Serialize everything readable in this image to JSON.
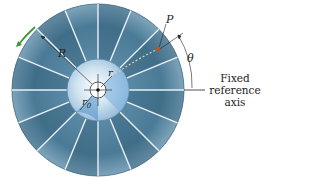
{
  "figure": {
    "labels": {
      "R": "R",
      "r": "r",
      "r0_base": "r",
      "r0_sub": "0",
      "P": "P",
      "theta": "θ",
      "axis_line1": "Fixed",
      "axis_line2": "reference",
      "axis_line3": "axis"
    },
    "colors": {
      "disk_dark": "#3f6f8c",
      "disk_light": "#9fc0d3",
      "hub": "#cfe3f0",
      "hub_accent": "#4f8fc8",
      "rotation_arrow": "#3a9a3a",
      "point_P": "#c0502a",
      "path_dashes": "#d8d2a8"
    },
    "vane_count": 16,
    "icons": {
      "rotation_arrow": "curved-arrow-icon"
    }
  }
}
